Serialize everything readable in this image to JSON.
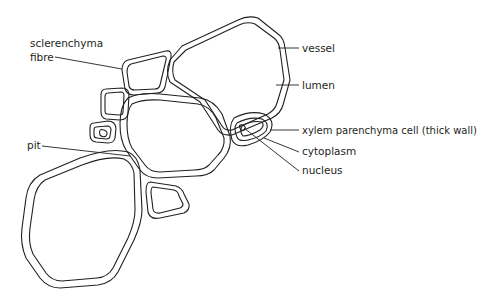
{
  "diagram": {
    "labels": {
      "sclerenchyma_fibre_1": "sclerenchyma",
      "sclerenchyma_fibre_2": "fibre",
      "vessel": "vessel",
      "lumen": "lumen",
      "xylem_parenchyma": "xylem parenchyma cell (thick wall)",
      "cytoplasm": "cytoplasm",
      "nucleus": "nucleus",
      "pit": "pit"
    },
    "colors": {
      "line": "#231f20",
      "background": "#ffffff"
    }
  }
}
